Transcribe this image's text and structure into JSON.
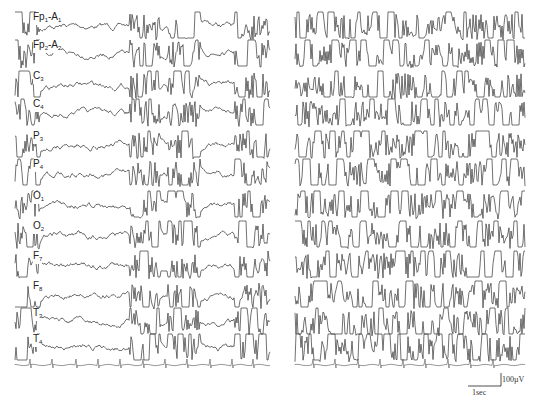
{
  "figure": {
    "panels": [
      "left",
      "right"
    ],
    "scale_bar": {
      "amplitude_label": "100µV",
      "time_label": "1sec"
    },
    "caption": ""
  },
  "chart_data": {
    "type": "line",
    "title": "",
    "xlabel": "time",
    "ylabel": "amplitude",
    "grid": false,
    "legend": "none",
    "channels": [
      {
        "name": "Fp1-A1",
        "main": "Fp",
        "sub1": "1",
        "mid": "-A",
        "sub2": "1",
        "baseline_y": 26
      },
      {
        "name": "Fp2-A2",
        "main": "Fp",
        "sub1": "2",
        "mid": "-A",
        "sub2": "2",
        "baseline_y": 54
      },
      {
        "name": "C3",
        "main": "C",
        "sub1": "3",
        "mid": "",
        "sub2": "",
        "baseline_y": 85
      },
      {
        "name": "C4",
        "main": "C",
        "sub1": "4",
        "mid": "",
        "sub2": "",
        "baseline_y": 113
      },
      {
        "name": "P3",
        "main": "P",
        "sub1": "3",
        "mid": "",
        "sub2": "",
        "baseline_y": 145
      },
      {
        "name": "P4",
        "main": "P",
        "sub1": "4",
        "mid": "",
        "sub2": "",
        "baseline_y": 173
      },
      {
        "name": "O1",
        "main": "O",
        "sub1": "1",
        "mid": "",
        "sub2": "",
        "baseline_y": 205
      },
      {
        "name": "O2",
        "main": "O",
        "sub1": "2",
        "mid": "",
        "sub2": "",
        "baseline_y": 235
      },
      {
        "name": "F7",
        "main": "F",
        "sub1": "7",
        "mid": "",
        "sub2": "",
        "baseline_y": 265
      },
      {
        "name": "F8",
        "main": "F",
        "sub1": "8",
        "mid": "",
        "sub2": "",
        "baseline_y": 295
      },
      {
        "name": "T3",
        "main": "T",
        "sub1": "3",
        "mid": "",
        "sub2": "",
        "baseline_y": 322
      },
      {
        "name": "T4",
        "main": "T",
        "sub1": "4",
        "mid": "",
        "sub2": "",
        "baseline_y": 348
      },
      {
        "name": "ECG",
        "main": "",
        "sub1": "",
        "mid": "",
        "sub2": "",
        "baseline_y": 365
      }
    ],
    "ecg_beats_x": {
      "left": [
        30,
        52,
        76,
        98,
        120,
        143,
        165,
        187,
        210,
        232,
        253
      ],
      "right": [
        292,
        313,
        335,
        358,
        380,
        403,
        425,
        448,
        470,
        493
      ]
    },
    "panel_x_ranges": {
      "left": [
        15,
        270
      ],
      "right": [
        295,
        525
      ]
    },
    "scale": {
      "amplitude_uV": 100,
      "time_s": 1
    }
  }
}
